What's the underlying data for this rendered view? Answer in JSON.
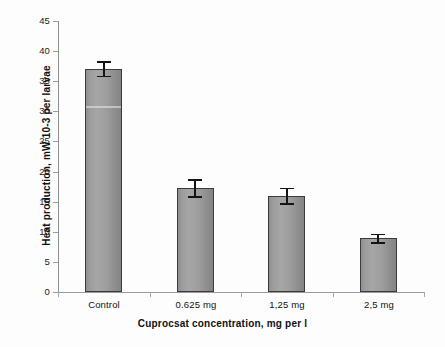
{
  "chart_data": {
    "type": "bar",
    "title": "",
    "xlabel": "Cuprocsat concentration, mg per l",
    "ylabel": "Heat production, mW 10-3 per larvae",
    "categories": [
      "Control",
      "0.625 mg",
      "1,25 mg",
      "2,5 mg"
    ],
    "values": [
      37.1,
      17.3,
      16.0,
      9.0
    ],
    "errors": [
      1.2,
      1.4,
      1.3,
      0.7
    ],
    "series": [
      {
        "name": "Heat production",
        "values": [
          37.1,
          17.3,
          16.0,
          9.0
        ],
        "errors": [
          1.2,
          1.4,
          1.3,
          0.7
        ]
      }
    ],
    "ylim": [
      0,
      45
    ],
    "ytick_values": [
      0,
      5,
      10,
      15,
      20,
      25,
      30,
      35,
      40,
      45
    ],
    "ytick_labels": [
      "0",
      "5",
      "10",
      "15",
      "20",
      "25",
      "30",
      "35",
      "40",
      "45"
    ],
    "grid": false,
    "legend": false,
    "legend_position": "none",
    "bar_color": "#9c9c9c",
    "bar_edge_color": "#3b3b3b",
    "error_bar_color": "#141414",
    "axis_color": "#9a9a9a",
    "background_color": "#ffffff",
    "text_color": "#111111"
  }
}
